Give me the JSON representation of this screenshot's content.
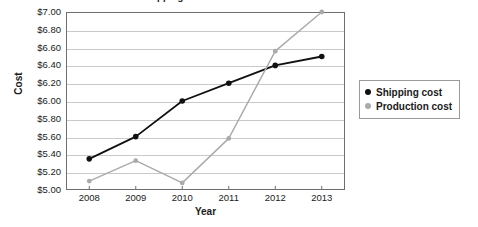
{
  "chart_data": {
    "type": "line",
    "title": "Cost of Shipping and Production 2008-2013",
    "xlabel": "Year",
    "ylabel": "Cost",
    "categories": [
      "2008",
      "2009",
      "2010",
      "2011",
      "2012",
      "2013"
    ],
    "x": [
      2008,
      2009,
      2010,
      2011,
      2012,
      2013
    ],
    "ylim": [
      5.0,
      7.0
    ],
    "ytick_step": 0.2,
    "ytick_labels": [
      "$5.00",
      "$5.20",
      "$5.40",
      "$5.60",
      "$5.80",
      "$6.00",
      "$6.20",
      "$6.40",
      "$6.60",
      "$6.80",
      "$7.00"
    ],
    "ytick_values": [
      5.0,
      5.2,
      5.4,
      5.6,
      5.8,
      6.0,
      6.2,
      6.4,
      6.6,
      6.8,
      7.0
    ],
    "grid": true,
    "legend_position": "right",
    "series": [
      {
        "name": "Shipping cost",
        "color": "#111111",
        "values": [
          5.35,
          5.6,
          6.0,
          6.2,
          6.4,
          6.5
        ]
      },
      {
        "name": "Production cost",
        "color": "#aaaaaa",
        "values": [
          5.1,
          5.33,
          5.08,
          5.58,
          6.56,
          7.0
        ]
      }
    ]
  },
  "legend": {
    "items": [
      {
        "label": "Shipping cost",
        "color": "#111111"
      },
      {
        "label": "Production cost",
        "color": "#aaaaaa"
      }
    ]
  }
}
